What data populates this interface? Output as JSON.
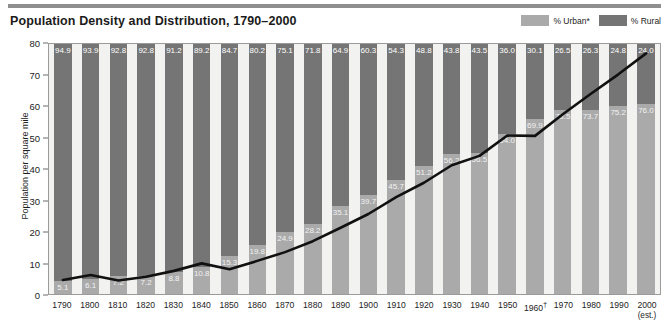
{
  "header": {
    "title": "Population Density and Distribution, 1790–2000"
  },
  "legend": {
    "items": [
      {
        "label": "% Urban*",
        "color": "#aaaaaa"
      },
      {
        "label": "% Rural",
        "color": "#757575"
      }
    ]
  },
  "axes": {
    "y_title": "Population per square mile",
    "y_ticks": [
      "0",
      "10",
      "20",
      "30",
      "40",
      "50",
      "60",
      "70",
      "80"
    ]
  },
  "chart_data": {
    "type": "bar",
    "title": "Population Density and Distribution, 1790–2000",
    "xlabel": "",
    "ylabel": "Population per square mile",
    "ylim": [
      0,
      80
    ],
    "grid": false,
    "legend_position": "top-right",
    "categories": [
      "1790",
      "1800",
      "1810",
      "1820",
      "1830",
      "1840",
      "1850",
      "1860",
      "1870",
      "1880",
      "1890",
      "1900",
      "1910",
      "1920",
      "1930",
      "1940",
      "1950",
      "1960",
      "1970",
      "1980",
      "1990",
      "2000"
    ],
    "category_labels": [
      "1790",
      "1800",
      "1810",
      "1820",
      "1830",
      "1840",
      "1850",
      "1860",
      "1870",
      "1880",
      "1890",
      "1900",
      "1910",
      "1920",
      "1930",
      "1940",
      "1950",
      "1960†",
      "1970",
      "1980",
      "1990",
      "2000"
    ],
    "category_sublabels": [
      "",
      "",
      "",
      "",
      "",
      "",
      "",
      "",
      "",
      "",
      "",
      "",
      "",
      "",
      "",
      "",
      "",
      "",
      "",
      "",
      "",
      "(est.)"
    ],
    "stacked": true,
    "stack_total": 100,
    "series": [
      {
        "name": "% Rural",
        "color": "#757575",
        "values": [
          94.9,
          93.9,
          92.8,
          92.8,
          91.2,
          89.2,
          84.7,
          80.2,
          75.1,
          71.8,
          64.9,
          60.3,
          54.3,
          48.8,
          43.8,
          43.5,
          36.0,
          30.1,
          26.5,
          26.3,
          24.8,
          24.0
        ]
      },
      {
        "name": "% Urban*",
        "color": "#aaaaaa",
        "values": [
          5.1,
          6.1,
          7.2,
          7.2,
          8.8,
          10.8,
          15.3,
          19.8,
          24.9,
          28.2,
          35.1,
          39.7,
          45.7,
          51.2,
          56.2,
          56.5,
          64.0,
          69.9,
          73.5,
          73.7,
          75.2,
          76.0
        ]
      }
    ],
    "overlay_line": {
      "name": "Population per square mile",
      "color": "#111111",
      "values": [
        4.5,
        6.1,
        4.3,
        5.5,
        7.4,
        9.8,
        7.9,
        10.6,
        13.4,
        16.9,
        21.2,
        25.6,
        31.0,
        35.6,
        41.2,
        44.2,
        50.7,
        50.6,
        57.5,
        64.0,
        70.3,
        77.0
      ]
    }
  }
}
